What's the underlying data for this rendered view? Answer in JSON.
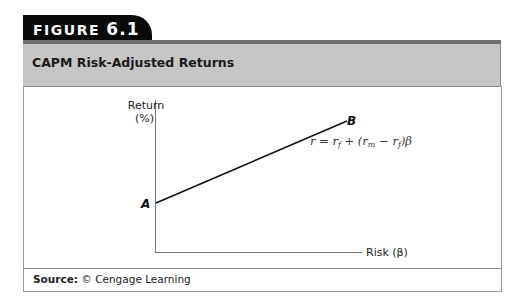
{
  "figure": {
    "label_prefix": "FIGURE",
    "label_number": "6.1",
    "title": "CAPM Risk-Adjusted Returns",
    "source_label": "Source:",
    "source_text": "© Cengage Learning"
  },
  "diagram": {
    "y_axis_label_line1": "Return",
    "y_axis_label_line2": "(%)",
    "x_axis_label": "Risk (β)",
    "point_a": "A",
    "point_b": "B",
    "equation": "r = rf + (rm − rf)β"
  },
  "colors": {
    "tab_bg": "#0a0a0a",
    "header_bg": "#c6c6c6",
    "header_rule": "#6f6f6f"
  }
}
